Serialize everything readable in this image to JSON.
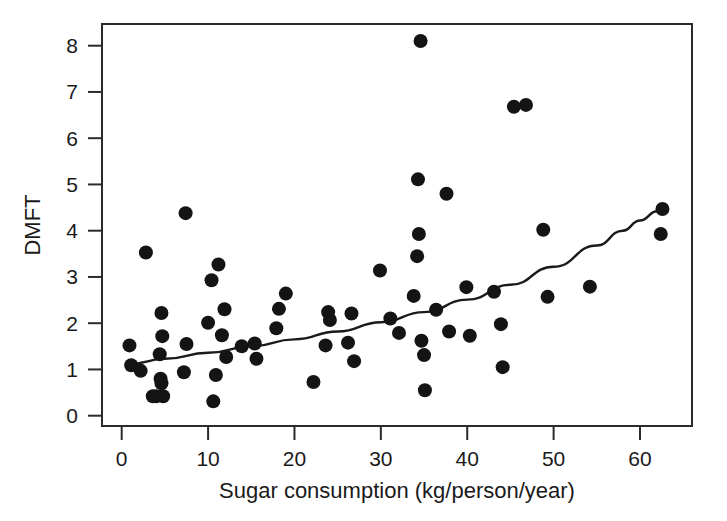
{
  "figure": {
    "background_color": "#ffffff",
    "ink_color": "#1a1a1a",
    "point_color": "#141414",
    "curve_color": "#1a1a1a"
  },
  "chart_data": {
    "type": "scatter",
    "title": "",
    "subtitle": "",
    "xlabel": "Sugar consumption (kg/person/year)",
    "ylabel": "DMFT",
    "xlim": [
      -1.5,
      66
    ],
    "ylim": [
      -0.25,
      8.7
    ],
    "xticks": [
      0,
      10,
      20,
      30,
      40,
      50,
      60
    ],
    "xticklabels": [
      "0",
      "10",
      "20",
      "30",
      "40",
      "50",
      "60"
    ],
    "yticks": [
      0,
      1,
      2,
      3,
      4,
      5,
      6,
      7,
      8
    ],
    "yticklabels": [
      "0",
      "1",
      "2",
      "3",
      "4",
      "5",
      "6",
      "7",
      "8"
    ],
    "grid": false,
    "legend": null,
    "legend_position": "none",
    "marker": "filled-circle",
    "marker_size_px": 7.2,
    "points": [
      [
        0.9,
        1.52
      ],
      [
        1.1,
        1.09
      ],
      [
        2.2,
        0.97
      ],
      [
        2.8,
        3.53
      ],
      [
        3.6,
        0.42
      ],
      [
        4.0,
        0.42
      ],
      [
        4.4,
        1.33
      ],
      [
        4.5,
        0.8
      ],
      [
        4.6,
        0.7
      ],
      [
        4.6,
        2.22
      ],
      [
        4.7,
        1.72
      ],
      [
        4.8,
        0.42
      ],
      [
        7.2,
        0.94
      ],
      [
        7.4,
        4.38
      ],
      [
        7.5,
        1.55
      ],
      [
        10.0,
        2.01
      ],
      [
        10.4,
        2.93
      ],
      [
        10.6,
        0.31
      ],
      [
        10.9,
        0.88
      ],
      [
        11.2,
        3.27
      ],
      [
        11.6,
        1.74
      ],
      [
        11.9,
        2.3
      ],
      [
        12.1,
        1.27
      ],
      [
        13.9,
        1.5
      ],
      [
        15.4,
        1.56
      ],
      [
        15.6,
        1.23
      ],
      [
        17.9,
        1.89
      ],
      [
        18.2,
        2.31
      ],
      [
        19.0,
        2.64
      ],
      [
        22.2,
        0.73
      ],
      [
        23.6,
        1.52
      ],
      [
        23.9,
        2.24
      ],
      [
        24.1,
        2.07
      ],
      [
        26.2,
        1.58
      ],
      [
        26.6,
        2.21
      ],
      [
        26.9,
        1.18
      ],
      [
        29.9,
        3.14
      ],
      [
        31.1,
        2.1
      ],
      [
        32.1,
        1.79
      ],
      [
        33.8,
        2.59
      ],
      [
        34.2,
        3.45
      ],
      [
        34.3,
        5.11
      ],
      [
        34.4,
        3.93
      ],
      [
        34.6,
        8.1
      ],
      [
        34.7,
        1.62
      ],
      [
        35.0,
        1.31
      ],
      [
        35.1,
        0.55
      ],
      [
        36.4,
        2.29
      ],
      [
        37.6,
        4.8
      ],
      [
        37.9,
        1.82
      ],
      [
        39.9,
        2.78
      ],
      [
        40.3,
        1.73
      ],
      [
        43.1,
        2.68
      ],
      [
        43.9,
        1.98
      ],
      [
        44.1,
        1.05
      ],
      [
        45.4,
        6.68
      ],
      [
        46.8,
        6.72
      ],
      [
        48.8,
        4.02
      ],
      [
        49.3,
        2.57
      ],
      [
        54.2,
        2.79
      ],
      [
        62.4,
        3.93
      ],
      [
        62.6,
        4.47
      ]
    ],
    "fit_curve": {
      "label": "fitted exponential trend",
      "x": [
        1.0,
        5.0,
        10.0,
        15.0,
        20.0,
        25.0,
        30.0,
        35.0,
        40.0,
        45.0,
        50.0,
        55.0,
        58.0,
        60.0,
        62.0,
        62.6
      ],
      "y": [
        1.12,
        1.23,
        1.36,
        1.5,
        1.65,
        1.82,
        2.02,
        2.24,
        2.51,
        2.83,
        3.22,
        3.68,
        4.0,
        4.22,
        4.42,
        4.48
      ]
    }
  },
  "axis": {
    "x_title": "Sugar consumption (kg/person/year)",
    "y_title": "DMFT"
  }
}
